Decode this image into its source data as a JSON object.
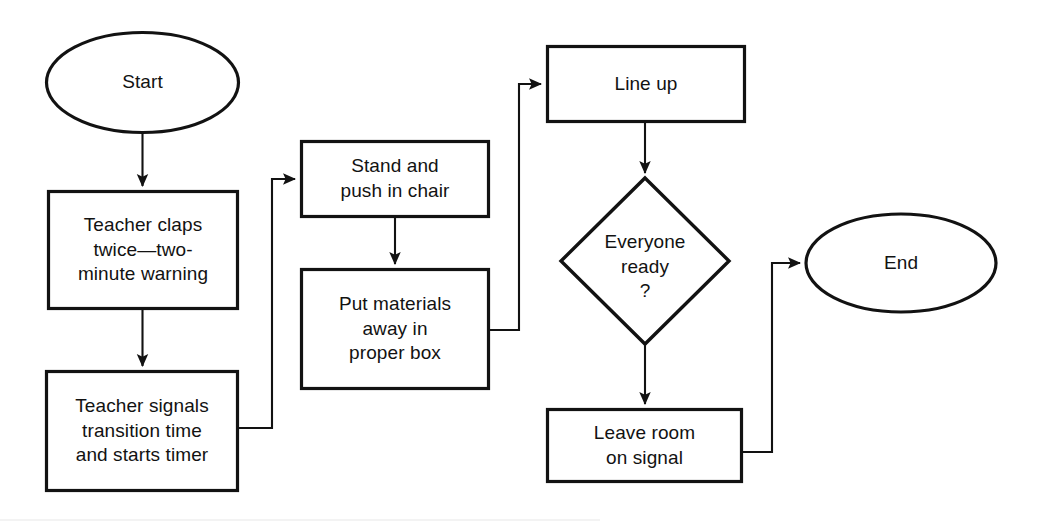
{
  "diagram": {
    "type": "flowchart",
    "orientation": "left-to-right columns with vertical flow",
    "background_color": "#ffffff",
    "line_color": "#121212",
    "text_color": "#121212",
    "nodes": [
      {
        "id": "start",
        "shape": "ellipse",
        "label": "Start",
        "x": 45,
        "y": 32,
        "w": 195,
        "h": 101
      },
      {
        "id": "teacher-claps",
        "shape": "rectangle",
        "label": "Teacher claps\ntwice—two-\nminute warning",
        "x": 47,
        "y": 190,
        "w": 192,
        "h": 120
      },
      {
        "id": "teacher-signals",
        "shape": "rectangle",
        "label": "Teacher signals\ntransition time\nand starts timer",
        "x": 45,
        "y": 370,
        "w": 194,
        "h": 122
      },
      {
        "id": "stand-push-chair",
        "shape": "rectangle",
        "label": "Stand and\npush in chair",
        "x": 300,
        "y": 140,
        "w": 190,
        "h": 78
      },
      {
        "id": "put-materials-away",
        "shape": "rectangle",
        "label": "Put materials\naway in\nproper box",
        "x": 300,
        "y": 268,
        "w": 190,
        "h": 122
      },
      {
        "id": "line-up",
        "shape": "rectangle",
        "label": "Line up",
        "x": 546,
        "y": 45,
        "w": 200,
        "h": 78
      },
      {
        "id": "everyone-ready",
        "shape": "diamond",
        "label": "Everyone\nready\n?",
        "x": 560,
        "y": 177,
        "w": 170,
        "h": 168
      },
      {
        "id": "leave-room",
        "shape": "rectangle",
        "label": "Leave room\non signal",
        "x": 546,
        "y": 408,
        "w": 197,
        "h": 75
      },
      {
        "id": "end",
        "shape": "ellipse",
        "label": "End",
        "x": 805,
        "y": 213,
        "w": 192,
        "h": 100
      }
    ],
    "edges": [
      {
        "id": "start-to-claps",
        "from": "start",
        "to": "teacher-claps",
        "style": "straight-vertical",
        "arrow": true
      },
      {
        "id": "claps-to-signals",
        "from": "teacher-claps",
        "to": "teacher-signals",
        "style": "straight-vertical",
        "arrow": true
      },
      {
        "id": "signals-to-stand",
        "from": "teacher-signals",
        "to": "stand-push-chair",
        "style": "right-up-right elbow",
        "arrow": true
      },
      {
        "id": "stand-to-materials",
        "from": "stand-push-chair",
        "to": "put-materials-away",
        "style": "straight-vertical",
        "arrow": true
      },
      {
        "id": "materials-to-lineup",
        "from": "put-materials-away",
        "to": "line-up",
        "style": "right-up-right elbow",
        "arrow": true
      },
      {
        "id": "lineup-to-ready",
        "from": "line-up",
        "to": "everyone-ready",
        "style": "straight-vertical",
        "arrow": true
      },
      {
        "id": "ready-to-leave",
        "from": "everyone-ready",
        "to": "leave-room",
        "style": "straight-vertical",
        "arrow": true
      },
      {
        "id": "leave-to-end",
        "from": "leave-room",
        "to": "end",
        "style": "right-up-right elbow",
        "arrow": true
      }
    ]
  }
}
